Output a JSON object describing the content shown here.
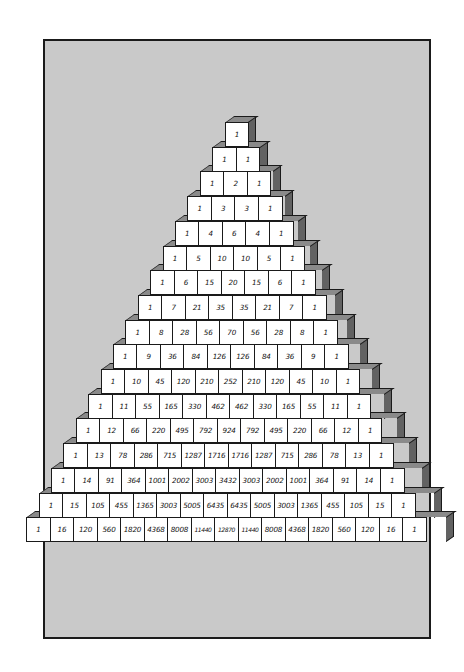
{
  "figure": {
    "colors": {
      "page_background": "#ffffff",
      "frame_background": "#c9c9c9",
      "frame_border": "#1a1a1a",
      "block_front": "#ffffff",
      "block_top": "#8a8a8a",
      "block_side": "#626262",
      "text": "#111111"
    },
    "rows": [
      [
        "1"
      ],
      [
        "1",
        "1"
      ],
      [
        "1",
        "2",
        "1"
      ],
      [
        "1",
        "3",
        "3",
        "1"
      ],
      [
        "1",
        "4",
        "6",
        "4",
        "1"
      ],
      [
        "1",
        "5",
        "10",
        "10",
        "5",
        "1"
      ],
      [
        "1",
        "6",
        "15",
        "20",
        "15",
        "6",
        "1"
      ],
      [
        "1",
        "7",
        "21",
        "35",
        "35",
        "21",
        "7",
        "1"
      ],
      [
        "1",
        "8",
        "28",
        "56",
        "70",
        "56",
        "28",
        "8",
        "1"
      ],
      [
        "1",
        "9",
        "36",
        "84",
        "126",
        "126",
        "84",
        "36",
        "9",
        "1"
      ],
      [
        "1",
        "10",
        "45",
        "120",
        "210",
        "252",
        "210",
        "120",
        "45",
        "10",
        "1"
      ],
      [
        "1",
        "11",
        "55",
        "165",
        "330",
        "462",
        "462",
        "330",
        "165",
        "55",
        "11",
        "1"
      ],
      [
        "1",
        "12",
        "66",
        "220",
        "495",
        "792",
        "924",
        "792",
        "495",
        "220",
        "66",
        "12",
        "1"
      ],
      [
        "1",
        "13",
        "78",
        "286",
        "715",
        "1287",
        "1716",
        "1716",
        "1287",
        "715",
        "286",
        "78",
        "13",
        "1"
      ],
      [
        "1",
        "14",
        "91",
        "364",
        "1001",
        "2002",
        "3003",
        "3432",
        "3003",
        "2002",
        "1001",
        "364",
        "91",
        "14",
        "1"
      ],
      [
        "1",
        "15",
        "105",
        "455",
        "1365",
        "3003",
        "5005",
        "6435",
        "6435",
        "5005",
        "3003",
        "1365",
        "455",
        "105",
        "15",
        "1"
      ],
      [
        "1",
        "16",
        "120",
        "560",
        "1820",
        "4368",
        "8008",
        "11440",
        "12870",
        "11440",
        "8008",
        "4368",
        "1820",
        "560",
        "120",
        "16",
        "1"
      ]
    ]
  }
}
